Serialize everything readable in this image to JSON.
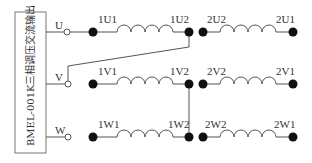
{
  "diagram": {
    "title_box": "BMEL-001K三相调压交流输出",
    "terminals": [
      {
        "id": "U",
        "label": "U",
        "y": 32
      },
      {
        "id": "V",
        "label": "V",
        "y": 84
      },
      {
        "id": "W",
        "label": "W",
        "y": 137
      }
    ],
    "windings": [
      {
        "row": "U",
        "left": "1U1",
        "right": "1U2",
        "group": 1
      },
      {
        "row": "V",
        "left": "1V1",
        "right": "1V2",
        "group": 1
      },
      {
        "row": "W",
        "left": "1W1",
        "right": "1W2",
        "group": 1
      },
      {
        "row": "U",
        "left": "2U2",
        "right": "2U1",
        "group": 2
      },
      {
        "row": "V",
        "left": "2V2",
        "right": "2V1",
        "group": 2
      },
      {
        "row": "W",
        "left": "2W2",
        "right": "2W1",
        "group": 2
      }
    ],
    "connections": [
      {
        "from": "V",
        "to": "1U2",
        "note": "V terminal wired to 1U2"
      },
      {
        "from": "1V2",
        "to": "1W2",
        "note": "1V2 and 1W2 tied together"
      }
    ],
    "colors": {
      "line": "#555555",
      "dot": "#111111",
      "box": "#777777"
    }
  }
}
